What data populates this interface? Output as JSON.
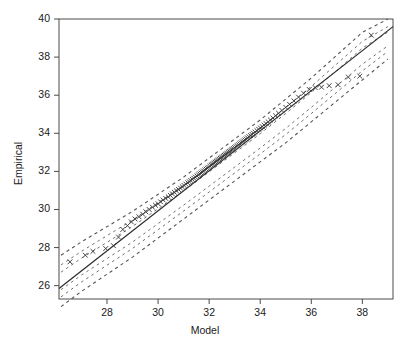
{
  "chart_data": {
    "type": "scatter",
    "title": "",
    "xlabel": "Model",
    "ylabel": "Empirical",
    "xlim": [
      26.12,
      39.2
    ],
    "ylim": [
      25.3,
      40.0
    ],
    "xticks": [
      28,
      30,
      32,
      34,
      36,
      38
    ],
    "xticklabels": [
      "28",
      "30",
      "32",
      "34",
      "36",
      "38"
    ],
    "yticks": [
      26,
      28,
      30,
      32,
      34,
      36,
      38,
      40
    ],
    "yticklabels": [
      "26",
      "28",
      "30",
      "32",
      "34",
      "36",
      "38",
      "40"
    ],
    "grid": false,
    "legend": null,
    "marker": "x",
    "marker_color": "#3a3a3a",
    "reference_line": {
      "style": "solid",
      "color": "#2b2b2b",
      "slope": 1.0,
      "intercept": 0.0,
      "label": "identity line",
      "x_start": 26.12,
      "y_start": 25.85,
      "x_end": 39.2,
      "y_end": 39.6
    },
    "envelope": {
      "style": "dashed",
      "color": "#555555",
      "description": "simulated confidence envelope, widening at the extremes",
      "x": [
        26.2,
        27.0,
        28.0,
        29.0,
        30.0,
        31.0,
        32.0,
        33.0,
        34.0,
        35.0,
        36.0,
        37.0,
        38.0,
        39.0
      ],
      "upper": [
        27.6,
        28.3,
        29.1,
        29.9,
        30.8,
        31.7,
        32.7,
        33.7,
        34.7,
        35.8,
        36.9,
        38.1,
        39.3,
        40.0
      ],
      "lower": [
        24.9,
        25.7,
        26.6,
        27.5,
        28.5,
        29.5,
        30.5,
        31.5,
        32.5,
        33.5,
        34.6,
        35.7,
        36.8,
        37.9
      ]
    },
    "series": [
      {
        "name": "Empirical vs Model",
        "x": [
          26.55,
          27.15,
          27.45,
          27.95,
          28.25,
          28.45,
          28.62,
          28.8,
          28.95,
          29.1,
          29.25,
          29.4,
          29.52,
          29.65,
          29.78,
          29.9,
          30.0,
          30.1,
          30.2,
          30.3,
          30.4,
          30.48,
          30.56,
          30.64,
          30.72,
          30.8,
          30.88,
          30.95,
          31.02,
          31.09,
          31.16,
          31.22,
          31.28,
          31.34,
          31.4,
          31.46,
          31.52,
          31.58,
          31.63,
          31.68,
          31.73,
          31.78,
          31.83,
          31.88,
          31.93,
          31.98,
          32.03,
          32.08,
          32.12,
          32.16,
          32.2,
          32.24,
          32.28,
          32.32,
          32.36,
          32.4,
          32.44,
          32.48,
          32.52,
          32.56,
          32.6,
          32.64,
          32.68,
          32.72,
          32.76,
          32.8,
          32.84,
          32.88,
          32.92,
          32.96,
          33.0,
          33.05,
          33.1,
          33.15,
          33.2,
          33.25,
          33.3,
          33.35,
          33.4,
          33.45,
          33.5,
          33.56,
          33.62,
          33.68,
          33.74,
          33.8,
          33.87,
          33.94,
          34.01,
          34.08,
          34.15,
          34.23,
          34.31,
          34.4,
          34.5,
          34.6,
          34.72,
          34.85,
          35.0,
          35.15,
          35.32,
          35.5,
          35.7,
          35.92,
          36.15,
          36.4,
          36.7,
          37.05,
          37.45,
          37.9,
          38.35
        ],
        "y": [
          27.25,
          27.6,
          27.8,
          27.95,
          28.1,
          28.55,
          28.95,
          29.15,
          29.35,
          29.5,
          29.62,
          29.75,
          29.88,
          30.0,
          30.12,
          30.22,
          30.3,
          30.4,
          30.5,
          30.58,
          30.66,
          30.74,
          30.82,
          30.9,
          30.98,
          31.05,
          31.12,
          31.19,
          31.26,
          31.33,
          31.4,
          31.46,
          31.52,
          31.58,
          31.64,
          31.7,
          31.76,
          31.82,
          31.87,
          31.92,
          31.97,
          32.02,
          32.07,
          32.12,
          32.17,
          32.22,
          32.27,
          32.32,
          32.36,
          32.4,
          32.44,
          32.48,
          32.52,
          32.56,
          32.6,
          32.64,
          32.68,
          32.72,
          32.76,
          32.8,
          32.84,
          32.88,
          32.92,
          32.96,
          33.0,
          33.04,
          33.08,
          33.12,
          33.16,
          33.2,
          33.25,
          33.3,
          33.35,
          33.4,
          33.45,
          33.5,
          33.55,
          33.6,
          33.65,
          33.7,
          33.76,
          33.82,
          33.88,
          33.94,
          34.0,
          34.07,
          34.14,
          34.21,
          34.28,
          34.35,
          34.43,
          34.51,
          34.6,
          34.7,
          34.8,
          34.92,
          35.05,
          35.2,
          35.36,
          35.52,
          35.7,
          35.9,
          36.1,
          36.3,
          36.4,
          36.42,
          36.5,
          36.55,
          36.95,
          37.0,
          39.15
        ]
      }
    ]
  }
}
